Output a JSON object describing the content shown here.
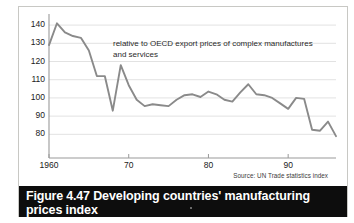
{
  "figure": {
    "caption_number": "Figure 4.47",
    "caption_title": "Developing countries' manufacturing prices index",
    "source": "Source: UN Trade statistics index",
    "annotation": "relative to OECD export prices of complex manufactures and services",
    "frame_color": "#c8c8c4",
    "caption_bar_color": "#0d0d0d",
    "caption_text_color": "#ffffff"
  },
  "chart_data": {
    "type": "line",
    "title": "Developing countries' manufacturing prices index",
    "subtitle": "relative to OECD export prices of complex manufactures and services",
    "xlabel": "",
    "ylabel": "",
    "source": "Source: UN Trade statistics index",
    "grid": true,
    "legend": "none",
    "line_color": "#8a8a8a",
    "grid_color": "#e2e2e2",
    "axis_color": "#9a9a9a",
    "xlim": [
      1960,
      1996
    ],
    "ylim": [
      67,
      145
    ],
    "xticks": [
      1960,
      1970,
      1980,
      1990
    ],
    "xtick_labels": [
      "1960",
      "70",
      "80",
      "90"
    ],
    "yticks": [
      80,
      90,
      100,
      110,
      120,
      130,
      140
    ],
    "ytick_labels": [
      "80",
      "90",
      "100",
      "110",
      "120",
      "130",
      "140"
    ],
    "x": [
      1960,
      1961,
      1962,
      1963,
      1964,
      1965,
      1966,
      1967,
      1968,
      1969,
      1970,
      1971,
      1972,
      1973,
      1974,
      1975,
      1976,
      1977,
      1978,
      1979,
      1980,
      1981,
      1982,
      1983,
      1984,
      1985,
      1986,
      1987,
      1988,
      1989,
      1990,
      1991,
      1992,
      1993,
      1994,
      1995,
      1996
    ],
    "values": [
      129,
      141,
      136,
      134,
      133,
      126,
      112,
      112,
      93,
      118,
      107,
      99,
      95.5,
      96.5,
      96,
      95.5,
      99,
      101.5,
      102,
      100.5,
      103.5,
      102,
      99,
      98,
      103,
      107.5,
      102,
      101.5,
      100,
      97,
      94,
      100,
      99.5,
      82.5,
      82,
      87,
      79
    ],
    "series_name": "Developing countries' manufacturing prices index"
  }
}
